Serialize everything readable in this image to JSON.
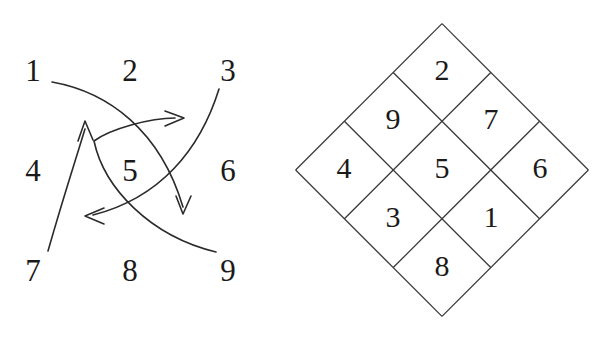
{
  "figure": {
    "background_color": "#ffffff",
    "ink_color": "#1a1a1a",
    "line_color": "#3a3a3a"
  },
  "left_panel": {
    "name": "permutation-arrow-diagram",
    "grid": {
      "rows": 3,
      "cols": 3,
      "labels": [
        "1",
        "2",
        "3",
        "4",
        "5",
        "6",
        "7",
        "8",
        "9"
      ],
      "positions": [
        {
          "label": "1",
          "x": 33,
          "y": 70
        },
        {
          "label": "2",
          "x": 130,
          "y": 70
        },
        {
          "label": "3",
          "x": 228,
          "y": 70
        },
        {
          "label": "4",
          "x": 33,
          "y": 170
        },
        {
          "label": "5",
          "x": 130,
          "y": 170
        },
        {
          "label": "6",
          "x": 228,
          "y": 170
        },
        {
          "label": "7",
          "x": 33,
          "y": 270
        },
        {
          "label": "8",
          "x": 130,
          "y": 270
        },
        {
          "label": "9",
          "x": 228,
          "y": 270
        }
      ]
    },
    "arrows": [
      {
        "name": "arrow-from-1-to-down",
        "from_label": "1",
        "head_direction": "down",
        "path": "M52,82 C108,92 160,130 183,207",
        "head": "M176,196 L183,214 L191,196"
      },
      {
        "name": "arrow-from-3-to-left",
        "from_label": "3",
        "head_direction": "left",
        "path": "M219,89 C200,150 160,198 93,215",
        "head": "M104,208 L85,216 L104,224"
      },
      {
        "name": "arrow-from-7-to-up",
        "from_label": "7",
        "head_direction": "up",
        "path": "M48,251 C64,195 74,165 85,129",
        "head": "M78,141 L85,121 L93,140"
      },
      {
        "name": "arrow-from-9-to-right",
        "from_label": "9",
        "head_direction": "right",
        "path": "M216,252 C150,236 104,188 94,141 C110,129 150,118 175,118",
        "head": "M165,111 L184,118 L165,126"
      }
    ]
  },
  "right_panel": {
    "name": "rotated-lattice-diagram",
    "rotation_degrees": 45,
    "center": {
      "x": 442,
      "y": 170
    },
    "half_diagonal": 147,
    "cell_size": 69,
    "grid": {
      "rows": 3,
      "cols": 3,
      "labels_by_row": [
        [
          "4",
          "9",
          "2"
        ],
        [
          "3",
          "5",
          "7"
        ],
        [
          "8",
          "1",
          "6"
        ]
      ],
      "cells": [
        {
          "label": "2",
          "x": 442,
          "y": 72
        },
        {
          "label": "9",
          "x": 393,
          "y": 121
        },
        {
          "label": "7",
          "x": 491,
          "y": 121
        },
        {
          "label": "4",
          "x": 344,
          "y": 170
        },
        {
          "label": "5",
          "x": 442,
          "y": 170
        },
        {
          "label": "6",
          "x": 540,
          "y": 170
        },
        {
          "label": "3",
          "x": 393,
          "y": 219
        },
        {
          "label": "1",
          "x": 491,
          "y": 219
        },
        {
          "label": "8",
          "x": 442,
          "y": 268
        }
      ]
    },
    "outline_vertices": [
      {
        "x": 442,
        "y": 23
      },
      {
        "x": 589,
        "y": 170
      },
      {
        "x": 442,
        "y": 317
      },
      {
        "x": 296,
        "y": 170
      }
    ]
  }
}
